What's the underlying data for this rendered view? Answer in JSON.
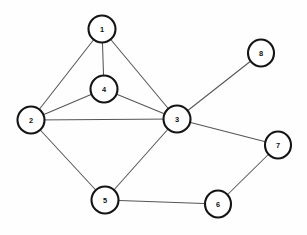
{
  "diagram": {
    "type": "node-link-graph",
    "width": 307,
    "height": 235,
    "background_color": "#fefefe",
    "node_fill_color": "#ffffff",
    "node_stroke_color": "#141414",
    "node_label_color": "#101010",
    "edge_color": "#555555",
    "node_stroke_width": 2.1,
    "edge_stroke_width": 1.05,
    "directed": false,
    "node_count": 8,
    "edge_count": 11
  },
  "nodes": [
    {
      "id": "1",
      "label": "1",
      "cx": 102,
      "cy": 29,
      "rx": 13.5,
      "ry": 13.5
    },
    {
      "id": "2",
      "label": "2",
      "cx": 31,
      "cy": 120,
      "rx": 13.5,
      "ry": 13.5
    },
    {
      "id": "3",
      "label": "3",
      "cx": 177,
      "cy": 119,
      "rx": 13.5,
      "ry": 13.5
    },
    {
      "id": "4",
      "label": "4",
      "cx": 104,
      "cy": 89,
      "rx": 13.5,
      "ry": 13.5
    },
    {
      "id": "5",
      "label": "5",
      "cx": 105,
      "cy": 200,
      "rx": 13.5,
      "ry": 13.5
    },
    {
      "id": "6",
      "label": "6",
      "cx": 218,
      "cy": 204,
      "rx": 13.0,
      "ry": 13.5
    },
    {
      "id": "7",
      "label": "7",
      "cx": 278,
      "cy": 145,
      "rx": 13.0,
      "ry": 13.5
    },
    {
      "id": "8",
      "label": "8",
      "cx": 261,
      "cy": 53,
      "rx": 13.0,
      "ry": 13.5
    }
  ],
  "edges": [
    {
      "id": "e-1-2",
      "source": "1",
      "target": "2",
      "x1": 102,
      "y1": 29,
      "x2": 31,
      "y2": 120
    },
    {
      "id": "e-1-4",
      "source": "1",
      "target": "4",
      "x1": 102,
      "y1": 29,
      "x2": 104,
      "y2": 89
    },
    {
      "id": "e-1-3",
      "source": "1",
      "target": "3",
      "x1": 102,
      "y1": 29,
      "x2": 177,
      "y2": 119
    },
    {
      "id": "e-2-4",
      "source": "2",
      "target": "4",
      "x1": 31,
      "y1": 120,
      "x2": 104,
      "y2": 89
    },
    {
      "id": "e-2-3",
      "source": "2",
      "target": "3",
      "x1": 31,
      "y1": 120,
      "x2": 177,
      "y2": 119
    },
    {
      "id": "e-2-5",
      "source": "2",
      "target": "5",
      "x1": 31,
      "y1": 120,
      "x2": 105,
      "y2": 200
    },
    {
      "id": "e-4-3",
      "source": "4",
      "target": "3",
      "x1": 104,
      "y1": 89,
      "x2": 177,
      "y2": 119
    },
    {
      "id": "e-3-5",
      "source": "3",
      "target": "5",
      "x1": 177,
      "y1": 119,
      "x2": 105,
      "y2": 200
    },
    {
      "id": "e-3-8",
      "source": "3",
      "target": "8",
      "x1": 177,
      "y1": 119,
      "x2": 261,
      "y2": 53
    },
    {
      "id": "e-3-7",
      "source": "3",
      "target": "7",
      "x1": 177,
      "y1": 119,
      "x2": 278,
      "y2": 145
    },
    {
      "id": "e-5-6",
      "source": "5",
      "target": "6",
      "x1": 105,
      "y1": 200,
      "x2": 218,
      "y2": 204
    },
    {
      "id": "e-6-7",
      "source": "6",
      "target": "7",
      "x1": 218,
      "y1": 204,
      "x2": 278,
      "y2": 145
    }
  ],
  "adjacency": {
    "1": [
      "2",
      "3",
      "4"
    ],
    "2": [
      "1",
      "3",
      "4",
      "5"
    ],
    "3": [
      "1",
      "2",
      "4",
      "5",
      "7",
      "8"
    ],
    "4": [
      "1",
      "2",
      "3"
    ],
    "5": [
      "2",
      "3",
      "6"
    ],
    "6": [
      "5",
      "7"
    ],
    "7": [
      "3",
      "6"
    ],
    "8": [
      "3"
    ]
  }
}
